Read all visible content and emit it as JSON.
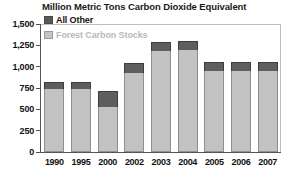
{
  "chart_data": {
    "type": "bar",
    "title": "Million Metric Tons Carbon Dioxide Equivalent",
    "xlabel": "",
    "ylabel": "",
    "stacked": true,
    "grid": false,
    "legend_position": "top-left",
    "ylim": [
      0,
      1500
    ],
    "yticks": [
      0,
      250,
      500,
      750,
      1000,
      1250,
      1500
    ],
    "ytick_labels": [
      "0",
      "250",
      "500",
      "750",
      "1,000",
      "1,250",
      "1,500"
    ],
    "categories": [
      "1990",
      "1995",
      "2000",
      "2002",
      "2003",
      "2004",
      "2005",
      "2006",
      "2007"
    ],
    "series": [
      {
        "name": "Forest Carbon Stocks",
        "color": "#c2c2c2",
        "values": [
          735,
          735,
          530,
          930,
          1180,
          1195,
          955,
          945,
          945
        ]
      },
      {
        "name": "All Other",
        "color": "#5e5e5e",
        "values": [
          90,
          90,
          185,
          115,
          110,
          105,
          105,
          110,
          110
        ]
      }
    ],
    "totals": [
      825,
      825,
      715,
      1045,
      1290,
      1300,
      1060,
      1055,
      1055
    ]
  },
  "legend": {
    "items": [
      {
        "label": "All Other",
        "swatch": "dark-gray-swatch-icon"
      },
      {
        "label": "Forest Carbon Stocks",
        "swatch": "light-gray-swatch-icon"
      }
    ]
  }
}
